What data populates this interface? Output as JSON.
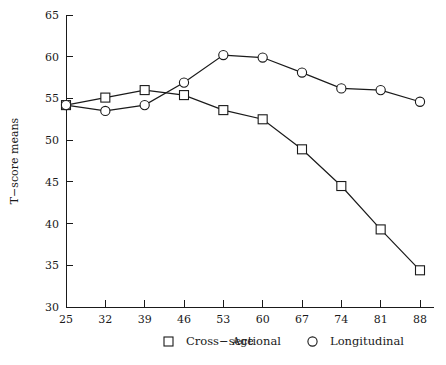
{
  "chart_data": {
    "type": "line",
    "title": "",
    "subtitle": "",
    "xlabel": "Age",
    "ylabel": "T−score means",
    "x": [
      25,
      32,
      39,
      46,
      53,
      60,
      67,
      74,
      81,
      88
    ],
    "xtick_labels": [
      "25",
      "32",
      "39",
      "46",
      "53",
      "60",
      "67",
      "74",
      "81",
      "88"
    ],
    "ytick_labels": [
      "30",
      "35",
      "40",
      "45",
      "50",
      "55",
      "60",
      "65"
    ],
    "yticks": [
      30,
      35,
      40,
      45,
      50,
      55,
      60,
      65
    ],
    "xlim": [
      25,
      88
    ],
    "ylim": [
      30,
      65
    ],
    "grid": false,
    "legend_position": "bottom",
    "series": [
      {
        "name": "Cross−sectional",
        "marker": "square",
        "color": "#1a1a1a",
        "values": [
          54.2,
          55.1,
          56.0,
          55.4,
          53.6,
          52.5,
          48.9,
          44.5,
          39.3,
          34.4
        ]
      },
      {
        "name": "Longitudinal",
        "marker": "circle",
        "color": "#1a1a1a",
        "values": [
          54.2,
          53.5,
          54.2,
          56.9,
          60.2,
          59.9,
          58.1,
          56.2,
          56.0,
          54.6
        ]
      }
    ]
  },
  "legend": {
    "items": [
      {
        "label": "Cross−sectional",
        "marker": "square-marker-icon"
      },
      {
        "label": "Longitudinal",
        "marker": "circle-marker-icon"
      }
    ]
  }
}
